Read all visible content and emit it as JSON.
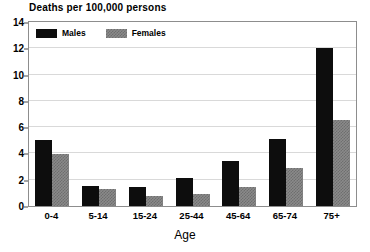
{
  "chart_data": {
    "type": "bar",
    "title": "Deaths per 100,000 persons",
    "xlabel": "Age",
    "ylabel": "",
    "categories": [
      "0-4",
      "5-14",
      "15-24",
      "25-44",
      "45-64",
      "65-74",
      "75+"
    ],
    "series": [
      {
        "name": "Males",
        "color": "#0d0d0d",
        "values": [
          5.0,
          1.5,
          1.45,
          2.1,
          3.4,
          5.1,
          12.0
        ]
      },
      {
        "name": "Females",
        "color": "#8a8a8a",
        "values": [
          3.95,
          1.3,
          0.75,
          0.95,
          1.45,
          2.9,
          6.55
        ]
      }
    ],
    "ylim": [
      0,
      14
    ],
    "yticks": [
      0,
      2,
      4,
      6,
      8,
      10,
      12,
      14
    ],
    "ytick_labels": [
      "0",
      "2",
      "4",
      "6",
      "8",
      "10",
      "12",
      "14"
    ],
    "grid": true,
    "legend_position": "top-left",
    "legend": [
      {
        "label": "Males",
        "swatch": "black-solid"
      },
      {
        "label": "Females",
        "swatch": "gray-checkered"
      }
    ]
  }
}
